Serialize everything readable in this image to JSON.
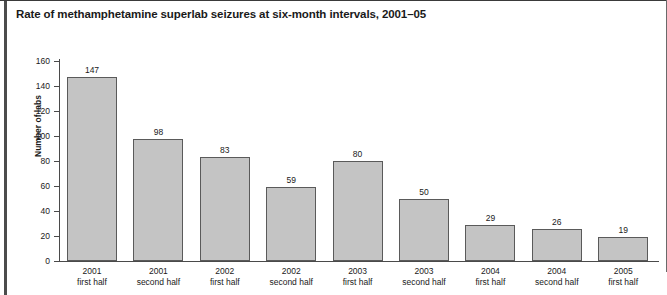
{
  "chart_data": {
    "type": "bar",
    "title": "Rate of methamphetamine superlab seizures at six-month intervals, 2001–05",
    "xlabel": "",
    "ylabel": "Number of labs",
    "ylim": [
      0,
      160
    ],
    "yticks": [
      0,
      20,
      40,
      60,
      80,
      100,
      120,
      140,
      160
    ],
    "grid": false,
    "legend": null,
    "bar_color": "#c4c4c4",
    "bar_border_color": "#5a5a5a",
    "categories": [
      "2001 first half",
      "2001 second half",
      "2002 first half",
      "2002 second half",
      "2003 first half",
      "2003 second half",
      "2004 first half",
      "2004 second half",
      "2005 first half"
    ],
    "category_lines": [
      [
        "2001",
        "first half"
      ],
      [
        "2001",
        "second half"
      ],
      [
        "2002",
        "first half"
      ],
      [
        "2002",
        "second half"
      ],
      [
        "2003",
        "first half"
      ],
      [
        "2003",
        "second half"
      ],
      [
        "2004",
        "first half"
      ],
      [
        "2004",
        "second half"
      ],
      [
        "2005",
        "first half"
      ]
    ],
    "values": [
      147,
      98,
      83,
      59,
      80,
      50,
      29,
      26,
      19
    ],
    "value_labels": [
      "147",
      "98",
      "83",
      "59",
      "80",
      "50",
      "29",
      "26",
      "19"
    ],
    "ytick_labels": [
      "0",
      "20",
      "40",
      "60",
      "80",
      "100",
      "120",
      "140",
      "160"
    ]
  }
}
